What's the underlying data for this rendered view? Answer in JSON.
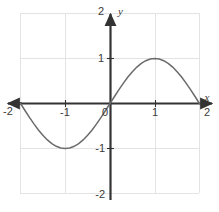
{
  "chart_data": {
    "type": "line",
    "title": "",
    "subtitle": "",
    "xlabel": "x",
    "ylabel": "y",
    "function": "y = sin(pi*x/2)",
    "xlim": [
      -2,
      2
    ],
    "ylim": [
      -2,
      2
    ],
    "grid": true,
    "legend": false,
    "x_ticks": [
      -2,
      -1,
      0,
      1,
      2
    ],
    "y_ticks": [
      -2,
      -1,
      1,
      2
    ],
    "x_tick_labels": [
      "-2",
      "-1",
      "0",
      "1",
      "2"
    ],
    "y_tick_labels": [
      "-2",
      "-1",
      "1",
      "2"
    ],
    "x": [
      -2,
      -1.9,
      -1.8,
      -1.7,
      -1.6,
      -1.5,
      -1.4,
      -1.3,
      -1.2,
      -1.1,
      -1,
      -0.9,
      -0.8,
      -0.7,
      -0.6,
      -0.5,
      -0.4,
      -0.3,
      -0.2,
      -0.1,
      0,
      0.1,
      0.2,
      0.3,
      0.4,
      0.5,
      0.6,
      0.7,
      0.8,
      0.9,
      1,
      1.1,
      1.2,
      1.3,
      1.4,
      1.5,
      1.6,
      1.7,
      1.8,
      1.9,
      2
    ],
    "values": [
      0,
      -0.156,
      -0.309,
      -0.454,
      -0.588,
      -0.707,
      -0.809,
      -0.891,
      -0.951,
      -0.988,
      -1,
      -0.988,
      -0.951,
      -0.891,
      -0.809,
      -0.707,
      -0.588,
      -0.454,
      -0.309,
      -0.156,
      0,
      0.156,
      0.309,
      0.454,
      0.588,
      0.707,
      0.809,
      0.891,
      0.951,
      0.988,
      1,
      0.988,
      0.951,
      0.891,
      0.809,
      0.707,
      0.588,
      0.454,
      0.309,
      0.156,
      0
    ],
    "series": [
      {
        "name": "y = sin(pi*x/2)",
        "color": "#6b6b6b",
        "values": [
          0,
          -0.156,
          -0.309,
          -0.454,
          -0.588,
          -0.707,
          -0.809,
          -0.891,
          -0.951,
          -0.988,
          -1,
          -0.988,
          -0.951,
          -0.891,
          -0.809,
          -0.707,
          -0.588,
          -0.454,
          -0.309,
          -0.156,
          0,
          0.156,
          0.309,
          0.454,
          0.588,
          0.707,
          0.809,
          0.891,
          0.951,
          0.988,
          1,
          0.988,
          0.951,
          0.891,
          0.809,
          0.707,
          0.588,
          0.454,
          0.309,
          0.156,
          0
        ]
      }
    ],
    "key_points": {
      "zeros": [
        -2,
        0,
        2
      ],
      "minimum": {
        "x": -1,
        "y": -1
      },
      "maximum": {
        "x": 1,
        "y": 1
      }
    }
  },
  "axis_labels": {
    "x_axis_name": "x",
    "y_axis_name": "y",
    "x_neg2": "-2",
    "x_neg1": "-1",
    "origin": "0",
    "x_pos1": "1",
    "x_pos2": "2",
    "y_pos2": "2",
    "y_pos1": "1",
    "y_neg1": "-1",
    "y_neg2": "-2"
  },
  "colors": {
    "grid": "#e3e3e3",
    "axis": "#333333",
    "curve": "#6b6b6b",
    "text": "#3a3a3a",
    "background": "#ffffff"
  }
}
